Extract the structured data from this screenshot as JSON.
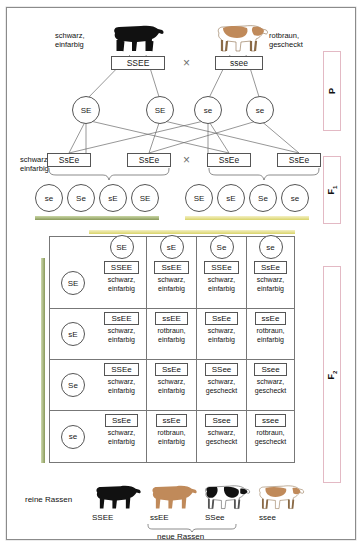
{
  "generation_tags": [
    {
      "id": "p",
      "label": "P",
      "sub": ""
    },
    {
      "id": "f1",
      "label": "F",
      "sub": "1"
    },
    {
      "id": "f2",
      "label": "F",
      "sub": "2"
    }
  ],
  "parents": {
    "left_pheno": "schwarz,\neinfarbig",
    "left_geno": "SSEE",
    "cross_symbol": "×",
    "right_pheno": "rotbraun,\ngescheckt",
    "right_geno": "ssee",
    "left_gametes": [
      "SE",
      "SE"
    ],
    "right_gametes": [
      "se",
      "se"
    ]
  },
  "f1": {
    "pheno": "schwarz,\neinfarbig",
    "genotypes": [
      "SsEe",
      "SsEe",
      "SsEe",
      "SsEe"
    ],
    "cross_symbol": "×",
    "gametes_left": [
      "se",
      "Se",
      "sE",
      "SE"
    ],
    "gametes_right": [
      "SE",
      "sE",
      "Se",
      "se"
    ]
  },
  "punnett": {
    "col_headers": [
      "SE",
      "sE",
      "Se",
      "se"
    ],
    "row_headers": [
      "SE",
      "sE",
      "Se",
      "se"
    ],
    "cells": [
      [
        {
          "geno": "SSEE",
          "pheno": "schwarz,\neinfarbig"
        },
        {
          "geno": "SsEE",
          "pheno": "schwarz,\neinfarbig"
        },
        {
          "geno": "SSEe",
          "pheno": "schwarz,\neinfarbig"
        },
        {
          "geno": "SsEe",
          "pheno": "schwarz,\neinfarbig"
        }
      ],
      [
        {
          "geno": "SsEE",
          "pheno": "schwarz,\neinfarbig"
        },
        {
          "geno": "ssEE",
          "pheno": "rotbraun,\neinfarbig"
        },
        {
          "geno": "SsEe",
          "pheno": "schwarz,\neinfarbig"
        },
        {
          "geno": "ssEe",
          "pheno": "rotbraun,\neinfarbig"
        }
      ],
      [
        {
          "geno": "SSEe",
          "pheno": "schwarz,\neinfarbig"
        },
        {
          "geno": "SsEe",
          "pheno": "schwarz,\neinfarbig"
        },
        {
          "geno": "SSee",
          "pheno": "schwarz,\ngescheckt"
        },
        {
          "geno": "Ssee",
          "pheno": "schwarz,\ngescheckt"
        }
      ],
      [
        {
          "geno": "SsEe",
          "pheno": "schwarz,\neinfarbig"
        },
        {
          "geno": "ssEe",
          "pheno": "rotbraun,\neinfarbig"
        },
        {
          "geno": "Ssee",
          "pheno": "schwarz,\ngescheckt"
        },
        {
          "geno": "ssee",
          "pheno": "rotbraun,\ngescheckt"
        }
      ]
    ]
  },
  "bottom": {
    "pure_label": "reine Rassen",
    "new_label": "neue Rassen",
    "genotypes": [
      "SSEE",
      "ssEE",
      "SSee",
      "ssee"
    ]
  },
  "colors": {
    "bar_green": "#8a9a5b",
    "bar_yellow": "#d9d46a",
    "gen_tag_border": "#e3b9c4",
    "line": "#6a6a6a",
    "cow_black": "#111111",
    "cow_brown": "#c08a5a",
    "cow_white": "#ffffff"
  }
}
